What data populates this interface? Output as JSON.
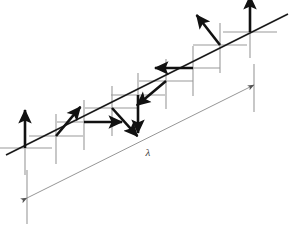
{
  "figure": {
    "width": 294,
    "height": 225,
    "background_color": "#ffffff"
  },
  "colors": {
    "spin_arrow": "#111111",
    "chain_axis": "#1a1a1a",
    "crosshair_axis": "#9a9a9a",
    "wavelength_line": "#8a8a8a",
    "label_text": "#3a3a3a"
  },
  "chain_axis": {
    "name": "propagation-axis",
    "x1": 6,
    "y1": 155,
    "x2": 288,
    "y2": 14,
    "stroke_width": 1.6
  },
  "wavelength": {
    "symbol": "λ",
    "label_x": 148,
    "label_y": 156,
    "line": {
      "x1": 27,
      "y1": 198,
      "x2": 254,
      "y2": 85
    },
    "start_tick": {
      "x": 27,
      "y_top": 170,
      "y_bottom": 224
    },
    "end_tick": {
      "x": 254,
      "y_top": 64,
      "y_bottom": 112
    },
    "double_headed": true
  },
  "sites": [
    {
      "index": 1,
      "name": "site-1",
      "cx": 25,
      "cy": 148,
      "spin_angle_deg": 90,
      "spin_direction": "up",
      "spin_length": 38,
      "h_arm": 27,
      "v_up": 20,
      "v_down": 27
    },
    {
      "index": 2,
      "name": "site-2",
      "cx": 56,
      "cy": 136,
      "spin_angle_deg": 50,
      "spin_direction": "up-right",
      "spin_length": 38,
      "h_arm": 27,
      "v_up": 22,
      "v_down": 28
    },
    {
      "index": 3,
      "name": "site-3",
      "cx": 84,
      "cy": 122,
      "spin_angle_deg": 0,
      "spin_direction": "right",
      "spin_length": 38,
      "h_arm": 27,
      "v_up": 22,
      "v_down": 28
    },
    {
      "index": 4,
      "name": "site-4",
      "cx": 112,
      "cy": 108,
      "spin_angle_deg": -48,
      "spin_direction": "down-right",
      "spin_length": 38,
      "h_arm": 27,
      "v_up": 22,
      "v_down": 28
    },
    {
      "index": 5,
      "name": "site-5",
      "cx": 138,
      "cy": 95,
      "spin_angle_deg": -90,
      "spin_direction": "down",
      "spin_length": 38,
      "h_arm": 27,
      "v_up": 22,
      "v_down": 28
    },
    {
      "index": 6,
      "name": "site-6",
      "cx": 166,
      "cy": 81,
      "spin_angle_deg": -140,
      "spin_direction": "down-left",
      "spin_length": 38,
      "h_arm": 27,
      "v_up": 22,
      "v_down": 28
    },
    {
      "index": 7,
      "name": "site-7",
      "cx": 193,
      "cy": 68,
      "spin_angle_deg": 180,
      "spin_direction": "left",
      "spin_length": 38,
      "h_arm": 27,
      "v_up": 22,
      "v_down": 28
    },
    {
      "index": 8,
      "name": "site-8",
      "cx": 220,
      "cy": 45,
      "spin_angle_deg": 128,
      "spin_direction": "up-left",
      "spin_length": 38,
      "h_arm": 27,
      "v_up": 22,
      "v_down": 28
    },
    {
      "index": 9,
      "name": "site-9",
      "cx": 250,
      "cy": 32,
      "spin_angle_deg": 90,
      "spin_direction": "up",
      "spin_length": 36,
      "h_arm": 27,
      "v_up": 20,
      "v_down": 26
    }
  ]
}
